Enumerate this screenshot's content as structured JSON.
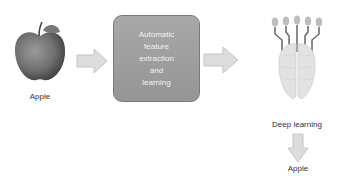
{
  "diagram": {
    "input": {
      "label": "Apple",
      "icon": "apple-image"
    },
    "process_box": {
      "label": "Automatic feature extraction and learning",
      "lines": [
        "Automatic",
        "feature",
        "extraction",
        "and",
        "learning"
      ]
    },
    "model": {
      "label": "Deep learning",
      "icon": "brain-network-icon"
    },
    "output": {
      "label": "Apple"
    },
    "colors": {
      "box_fill": "#9e9e9e",
      "arrow_fill": "#d9d9d9",
      "arrow_stroke": "#bdbdbd",
      "text": "#333333"
    }
  }
}
